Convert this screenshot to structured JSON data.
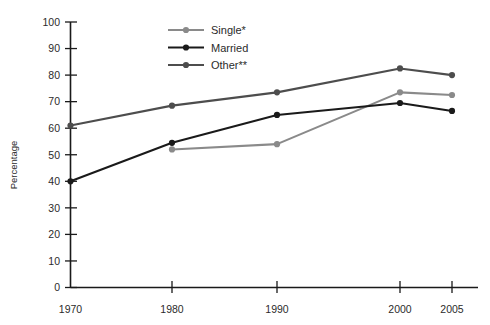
{
  "chart_data": {
    "type": "line",
    "title": "",
    "xlabel": "",
    "ylabel": "Percentage",
    "x": [
      1970,
      1980,
      1990,
      2000,
      2005
    ],
    "categories": [
      "1970",
      "1980",
      "1990",
      "2000",
      "2005"
    ],
    "ylim": [
      0,
      100
    ],
    "yticks": [
      0,
      10,
      20,
      30,
      40,
      50,
      60,
      70,
      80,
      90,
      100
    ],
    "ytick_labels": [
      "0",
      "10",
      "20",
      "30",
      "40",
      "50",
      "60",
      "70",
      "80",
      "90",
      "100"
    ],
    "xtick_labels": [
      "1970",
      "1980",
      "1990",
      "2000",
      "2005"
    ],
    "grid": false,
    "legend_position": "top-center",
    "series": [
      {
        "name": "Single*",
        "color": "#8a8a8a",
        "values": [
          null,
          52,
          54,
          73.5,
          72.5
        ]
      },
      {
        "name": "Married",
        "color": "#1a1a1a",
        "values": [
          40,
          54.5,
          65,
          69.5,
          66.5
        ]
      },
      {
        "name": "Other**",
        "color": "#4d4d4d",
        "values": [
          61,
          68.5,
          73.5,
          82.5,
          80
        ]
      }
    ]
  },
  "axes": {
    "y_title": "Percentage",
    "y_ticks": [
      "100",
      "90",
      "80",
      "70",
      "60",
      "50",
      "40",
      "30",
      "20",
      "10",
      "0"
    ],
    "x_ticks": [
      "1970",
      "1980",
      "1990",
      "2000",
      "2005"
    ]
  },
  "legend": {
    "items": [
      {
        "label": "Single*",
        "color": "#8a8a8a"
      },
      {
        "label": "Married",
        "color": "#1a1a1a"
      },
      {
        "label": "Other**",
        "color": "#4d4d4d"
      }
    ]
  }
}
